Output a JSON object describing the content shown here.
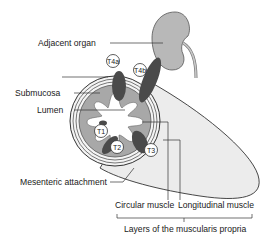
{
  "diagram": {
    "title": "",
    "labels": {
      "adjacent_organ": "Adjacent organ",
      "faded_label": "",
      "submucosa": "Submucosa",
      "lumen": "Lumen",
      "mesenteric_attachment": "Mesenteric attachment",
      "circular_muscle": "Circular muscle",
      "longitudinal_muscle": "Longitudinal muscle",
      "muscularis_propria": "Layers of the muscularis propria"
    },
    "stages": {
      "t1": "T1",
      "t2": "T2",
      "t3": "T3",
      "t4a": "T4a",
      "t4b": "T4b"
    },
    "colors": {
      "organ": "#b8b8b8",
      "submucosa": "#a8a8a8",
      "tumor": "#4a4a4a",
      "mesentery": "#ececec",
      "outline": "#333333"
    }
  }
}
